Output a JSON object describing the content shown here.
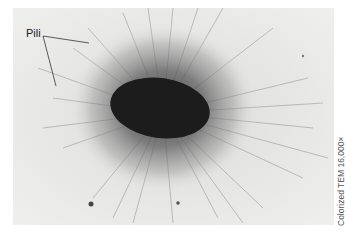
{
  "figure": {
    "label": "Pili",
    "caption": "Colorized TEM 16,000×",
    "colors": {
      "background": "#e9e9e8",
      "cell_body": "#1c1c1c",
      "pili_halo": "#6b6b6b",
      "leader_line": "#333333"
    }
  }
}
